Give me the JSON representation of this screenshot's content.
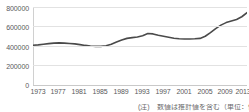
{
  "chart_data": {
    "type": "line",
    "title": "",
    "xlabel": "",
    "ylabel": "",
    "ylim": [
      0,
      800000
    ],
    "xlim": [
      1973,
      2014
    ],
    "grid": true,
    "legend": false,
    "line_color": "#4a4a4a",
    "grid_color": "#e2e2e2",
    "axis_color": "#c9c9c9",
    "tick_label_color": "#59595b",
    "y_ticks": [
      "800000",
      "600000",
      "400000",
      "200000",
      "0"
    ],
    "y_tick_values": [
      800000,
      600000,
      400000,
      200000,
      0
    ],
    "x_ticks": [
      "1973",
      "1977",
      "1981",
      "1985",
      "1989",
      "1993",
      "1997",
      "2001",
      "2005",
      "2009",
      "2013"
    ],
    "x_tick_values": [
      1973,
      1977,
      1981,
      1985,
      1989,
      1993,
      1997,
      2001,
      2005,
      2009,
      2013
    ],
    "x": [
      1973,
      1974,
      1975,
      1976,
      1977,
      1978,
      1979,
      1980,
      1981,
      1982,
      1983,
      1984,
      1985,
      1986,
      1987,
      1988,
      1989,
      1990,
      1991,
      1992,
      1993,
      1994,
      1995,
      1996,
      1997,
      1998,
      1999,
      2000,
      2001,
      2002,
      2003,
      2004,
      2005,
      2006,
      2007,
      2008,
      2009,
      2010,
      2011,
      2012,
      2013,
      2014
    ],
    "values": [
      408000,
      412000,
      418000,
      424000,
      430000,
      432000,
      430000,
      426000,
      422000,
      414000,
      406000,
      400000,
      396000,
      396000,
      402000,
      418000,
      440000,
      462000,
      478000,
      486000,
      492000,
      506000,
      528000,
      524000,
      510000,
      500000,
      490000,
      480000,
      474000,
      472000,
      472000,
      474000,
      478000,
      500000,
      538000,
      578000,
      614000,
      640000,
      656000,
      672000,
      700000,
      742000
    ],
    "series_name": ""
  },
  "caption": {
    "text": "(注)　数値は推計値を含む（単位：件）"
  }
}
